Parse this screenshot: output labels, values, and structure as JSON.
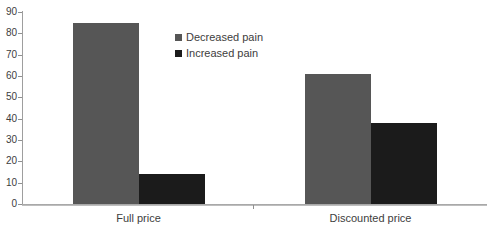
{
  "chart_data": {
    "type": "bar",
    "categories": [
      "Full price",
      "Discounted price"
    ],
    "series": [
      {
        "name": "Decreased pain",
        "color": "#565656",
        "values": [
          85,
          61
        ]
      },
      {
        "name": "Increased pain",
        "color": "#1b1b1b",
        "values": [
          14,
          38
        ]
      }
    ],
    "title": "",
    "xlabel": "",
    "ylabel": "",
    "ylim": [
      0,
      90
    ],
    "yticks": [
      0,
      10,
      20,
      30,
      40,
      50,
      60,
      70,
      80,
      90
    ],
    "grid": false,
    "legend": {
      "position": "inside-top-center-left",
      "entries": [
        "Decreased pain",
        "Increased pain"
      ]
    },
    "colors": {
      "axis": "#9e9e9e",
      "text": "#3d3d3d",
      "background": "#ffffff"
    }
  }
}
